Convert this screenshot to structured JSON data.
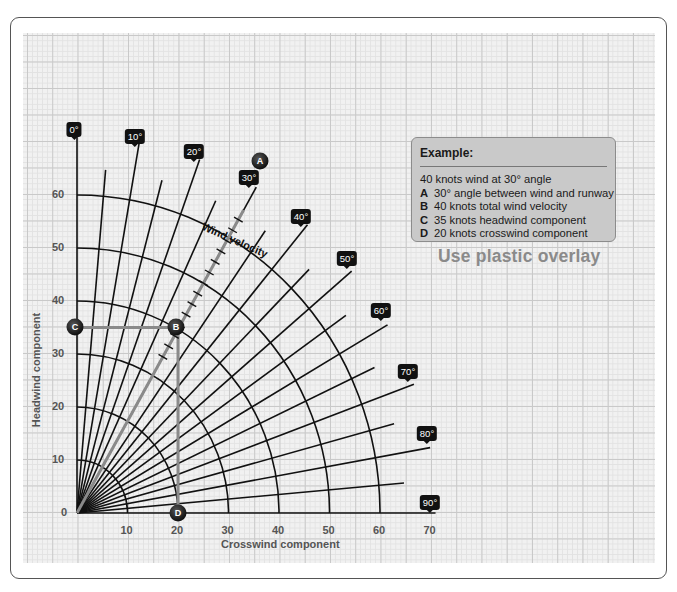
{
  "example": {
    "title": "Example:",
    "intro": "40 knots wind at 30° angle",
    "items": [
      {
        "key": "A",
        "text": "30° angle between wind and runway"
      },
      {
        "key": "B",
        "text": "40 knots total wind velocity"
      },
      {
        "key": "C",
        "text": "35 knots headwind component"
      },
      {
        "key": "D",
        "text": "20 knots crosswind component"
      }
    ]
  },
  "overlay_note": "Use plastic overlay",
  "axes": {
    "x_title": "Crosswind component",
    "y_title": "Headwind component",
    "x_ticks": [
      "10",
      "20",
      "30",
      "40",
      "50",
      "60",
      "70"
    ],
    "y_ticks": [
      "0",
      "10",
      "20",
      "30",
      "40",
      "50",
      "60"
    ]
  },
  "wind_velocity_label": "Wind velocity",
  "angle_labels": [
    "0°",
    "10°",
    "20°",
    "30°",
    "40°",
    "50°",
    "60°",
    "70°",
    "80°",
    "90°"
  ],
  "points": {
    "A": "A",
    "B": "B",
    "C": "C",
    "D": "D"
  },
  "colors": {
    "lines": "#111111",
    "construction": "#8a8a8a",
    "tag_bg": "#111111",
    "box_bg": "#c9c9c9"
  },
  "chart_data": {
    "type": "polar-crosswind-chart",
    "title": "",
    "xlabel": "Crosswind component",
    "ylabel": "Headwind component",
    "xlim": [
      0,
      70
    ],
    "ylim": [
      0,
      60
    ],
    "arc_radii": [
      10,
      20,
      30,
      40,
      50,
      60
    ],
    "radial_angles_deg": [
      0,
      5,
      10,
      15,
      20,
      25,
      30,
      35,
      40,
      45,
      50,
      55,
      60,
      65,
      70,
      75,
      80,
      85,
      90
    ],
    "labeled_angles_deg": [
      0,
      10,
      20,
      30,
      40,
      50,
      60,
      70,
      80,
      90
    ],
    "example": {
      "wind_speed_knots": 40,
      "wind_angle_deg": 30,
      "headwind_knots": 35,
      "crosswind_knots": 20
    },
    "points": [
      {
        "label": "A",
        "meaning": "30° angle between wind and runway"
      },
      {
        "label": "B",
        "x": 20,
        "y": 35,
        "meaning": "40 knots total wind velocity"
      },
      {
        "label": "C",
        "x": 0,
        "y": 35,
        "meaning": "35 knots headwind component"
      },
      {
        "label": "D",
        "x": 20,
        "y": 0,
        "meaning": "20 knots crosswind component"
      }
    ]
  }
}
